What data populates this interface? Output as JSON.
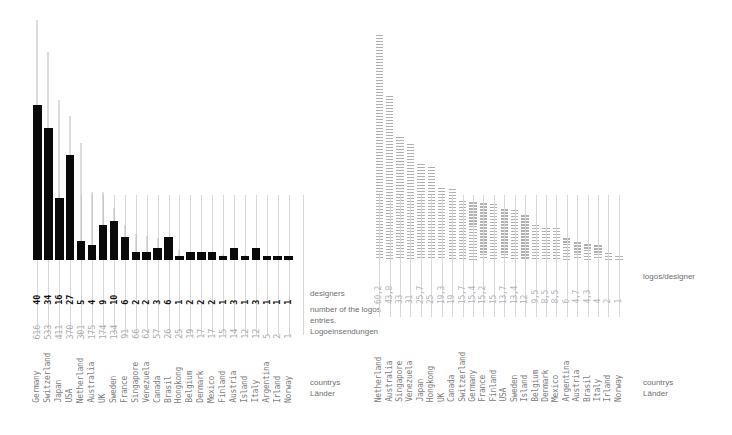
{
  "chart_data": [
    {
      "type": "bar",
      "id": "left",
      "title": "",
      "xlabel": "countrys / Länder",
      "ylabel": "",
      "categories": [
        "Germany",
        "Switzerland",
        "Japan",
        "USA",
        "Netherland",
        "Australia",
        "UK",
        "Sweden",
        "France",
        "Singapore",
        "Venezuela",
        "Canada",
        "Brasil",
        "Hongkong",
        "Belgium",
        "Denmark",
        "Mexico",
        "Finland",
        "Austria",
        "Island",
        "Italy",
        "Argentina",
        "Irland",
        "Norway"
      ],
      "series": [
        {
          "name": "designers",
          "values": [
            40,
            34,
            16,
            27,
            5,
            4,
            9,
            10,
            6,
            2,
            2,
            3,
            6,
            1,
            2,
            2,
            2,
            1,
            3,
            1,
            3,
            1,
            1,
            1
          ],
          "ylim": [
            0,
            40
          ],
          "color": "#0a0a0a",
          "render": "bar"
        },
        {
          "name": "number of the logos entries. Logoeinsendungen",
          "values": [
            616,
            533,
            411,
            370,
            301,
            175,
            174,
            134,
            91,
            66,
            62,
            57,
            26,
            25,
            19,
            17,
            17,
            15,
            14,
            12,
            12,
            5,
            2,
            1
          ],
          "ylim": [
            0,
            616
          ],
          "color": "#b9b9b9",
          "render": "line"
        }
      ],
      "grid": "vertical-ticks",
      "legend_position": "right"
    },
    {
      "type": "bar",
      "id": "right",
      "title": "",
      "xlabel": "countrys / Länder",
      "ylabel": "logos/designer",
      "categories": [
        "Netherland",
        "Australia",
        "Singapore",
        "Venezuela",
        "Japan",
        "Hongkong",
        "UK",
        "Canada",
        "Switzerland",
        "Germany",
        "France",
        "Finland",
        "USA",
        "Sweden",
        "Island",
        "Belgium",
        "Denmark",
        "Mexico",
        "Argentina",
        "Austria",
        "Brasil",
        "Italy",
        "Irland",
        "Norway"
      ],
      "values": [
        60.2,
        43.8,
        33,
        31,
        25.7,
        25,
        19.3,
        19,
        15.7,
        15.4,
        15.2,
        15,
        13.7,
        13.4,
        12,
        9.5,
        8.5,
        8.5,
        6,
        4.7,
        4.3,
        4,
        2,
        1
      ],
      "value_labels": [
        "60,2",
        "43,8",
        "33",
        "31",
        "25,7",
        "25",
        "19,3",
        "19",
        "15,7",
        "15,4",
        "15,2",
        "15",
        "13,7",
        "13,4",
        "12",
        "9,5",
        "8,5",
        "8,5",
        "6",
        "4,7",
        "4,3",
        "4",
        "2",
        "1"
      ],
      "ylim": [
        0,
        60.2
      ],
      "color": "#b0b0b0",
      "grid": "vertical-ticks",
      "legend_position": "right"
    }
  ],
  "left": {
    "legend": {
      "designers": "designers",
      "logos_line1": "number of the logos",
      "logos_line2": "entries.",
      "logos_line3": "Logoeinsendungen",
      "countries_line1": "countrys",
      "countries_line2": "Länder"
    }
  },
  "right": {
    "legend": {
      "ratio": "logos/designer",
      "countries_line1": "countrys",
      "countries_line2": "Länder"
    }
  },
  "colors": {
    "designer_bar": "#0a0a0a",
    "logos_line": "#b9b9b9",
    "ratio_bar": "#b0b0b0",
    "tick_rule": "#d8d8d8",
    "label_grey": "#adadad",
    "country_grey": "#7d7d7d",
    "legend_text": "#6f6f6f",
    "background": "#ffffff"
  }
}
